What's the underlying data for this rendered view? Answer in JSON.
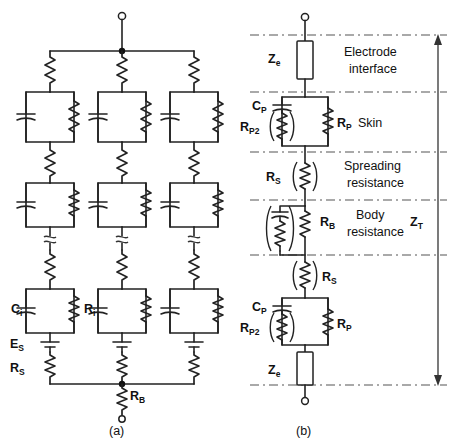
{
  "figure": {
    "background": "#ffffff",
    "ink_color": "#222222"
  },
  "panel_a": {
    "caption": "(a)",
    "terminal_top": "open-terminal",
    "terminal_bottom": "open-terminal",
    "branch_count": 3,
    "labels": {
      "ci": "C",
      "ci_sub": "i",
      "ri": "R",
      "ri_sub": "i",
      "es": "E",
      "es_sub": "S",
      "rs": "R",
      "rs_sub": "S",
      "rb": "R",
      "rb_sub": "B"
    },
    "element_order": [
      "series-resistor",
      "rc-parallel-block",
      "series-resistor",
      "rc-parallel-block",
      "break-squiggle",
      "series-resistor",
      "rc-parallel-block-ci-ri",
      "battery-Es",
      "series-resistor-Rs"
    ]
  },
  "panel_b": {
    "caption": "(b)",
    "terminal_top": "open-terminal",
    "terminal_bottom": "open-terminal",
    "total_impedance": {
      "symbol": "Z",
      "subscript": "T",
      "arrow": "double-headed-vertical-arrow"
    },
    "zones": [
      {
        "name": "Electrode interface",
        "lines": [
          "Electrode",
          "interface"
        ]
      },
      {
        "name": "Skin",
        "lines": [
          "Skin"
        ]
      },
      {
        "name": "Spreading resistance",
        "lines": [
          "Spreading",
          "resistance"
        ]
      },
      {
        "name": "Body resistance",
        "lines": [
          "Body",
          "resistance"
        ]
      },
      {
        "name": "Skin (lower)",
        "lines": []
      },
      {
        "name": "Electrode interface (lower)",
        "lines": []
      }
    ],
    "labels": {
      "ze_top": "Z",
      "ze_top_sub": "e",
      "cp_top": "C",
      "cp_top_sub": "P",
      "rp2_top": "R",
      "rp2_top_sub": "P2",
      "rp_top": "R",
      "rp_top_sub": "P",
      "rs_spread": "R",
      "rs_spread_sub": "S",
      "rb_body": "R",
      "rb_body_sub": "B",
      "rs_lower": "R",
      "rs_lower_sub": "S",
      "cp_bot": "C",
      "cp_bot_sub": "P",
      "rp2_bot": "R",
      "rp2_bot_sub": "P2",
      "rp_bot": "R",
      "rp_bot_sub": "P",
      "ze_bot": "Z",
      "ze_bot_sub": "e"
    }
  }
}
